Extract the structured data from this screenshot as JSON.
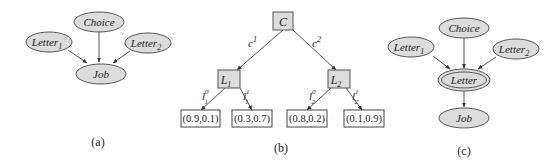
{
  "panels": {
    "a": {
      "caption": "(a)",
      "nodes": {
        "choice": "Choice",
        "letter1": {
          "base": "Letter",
          "sub": "1"
        },
        "letter2": {
          "base": "Letter",
          "sub": "2"
        },
        "job": "Job"
      }
    },
    "b": {
      "caption": "(b)",
      "root": "C",
      "root_edges": [
        {
          "base": "c",
          "sup": "1"
        },
        {
          "base": "c",
          "sup": "2"
        }
      ],
      "inner": [
        {
          "base": "L",
          "sub": "1"
        },
        {
          "base": "L",
          "sub": "2"
        }
      ],
      "inner_edges": [
        {
          "base": "l",
          "sup": "0",
          "sub": "1"
        },
        {
          "base": "l",
          "sup": "1",
          "sub": "1"
        },
        {
          "base": "l",
          "sup": "0",
          "sub": "2"
        },
        {
          "base": "l",
          "sup": "1",
          "sub": "2"
        }
      ],
      "leaves": [
        "(0.9,0.1)",
        "(0.3,0.7)",
        "(0.8,0.2)",
        "(0.1,0.9)"
      ]
    },
    "c": {
      "caption": "(c)",
      "nodes": {
        "choice": "Choice",
        "letter1": {
          "base": "Letter",
          "sub": "1"
        },
        "letter2": {
          "base": "Letter",
          "sub": "2"
        },
        "letter": "Letter",
        "job": "Job"
      }
    }
  },
  "colors": {
    "node_fill": "#dcdcdc",
    "stroke": "#555555"
  }
}
